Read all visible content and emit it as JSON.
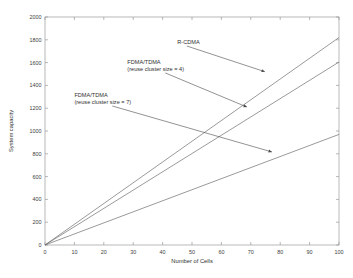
{
  "chart_data": {
    "type": "line",
    "title": "",
    "xlabel": "Number of Cells",
    "ylabel": "System capacity",
    "xlim": [
      0,
      100
    ],
    "ylim": [
      0,
      2000
    ],
    "xticks": [
      0,
      10,
      20,
      30,
      40,
      50,
      60,
      70,
      80,
      90,
      100
    ],
    "yticks": [
      0,
      200,
      400,
      600,
      800,
      1000,
      1200,
      1400,
      1600,
      1800,
      2000
    ],
    "grid": false,
    "legend_position": "none",
    "series": [
      {
        "name": "R-CDMA",
        "x": [
          0,
          100
        ],
        "values": [
          0,
          1820
        ]
      },
      {
        "name": "FDMA/TDMA (reuse cluster size = 4)",
        "x": [
          0,
          100
        ],
        "values": [
          0,
          1605
        ]
      },
      {
        "name": "FDMA/TDMA (reuse cluster size = 7)",
        "x": [
          0,
          100
        ],
        "values": [
          0,
          970
        ]
      }
    ],
    "annotations": [
      {
        "label_line1": "R-CDMA",
        "label_line2": "",
        "text_x": 45,
        "text_y": 1765,
        "arrow_x": 74.8,
        "arrow_y": 1520
      },
      {
        "label_line1": "FDMA/TDMA",
        "label_line2": "(reuse cluster size = 4)",
        "text_x": 28,
        "text_y": 1590,
        "arrow_x": 68.7,
        "arrow_y": 1210
      },
      {
        "label_line1": "FDMA/TDMA",
        "label_line2": "(reuse cluster size = 7)",
        "text_x": 10,
        "text_y": 1300,
        "arrow_x": 77.2,
        "arrow_y": 816
      }
    ]
  },
  "axes": {
    "x_tick_labels": [
      "0",
      "10",
      "20",
      "30",
      "40",
      "50",
      "60",
      "70",
      "80",
      "90",
      "100"
    ],
    "y_tick_labels": [
      "0",
      "200",
      "400",
      "600",
      "800",
      "1000",
      "1200",
      "1400",
      "1600",
      "1800",
      "2000"
    ],
    "x_axis_title": "Number of Cells",
    "y_axis_title": "System capacity"
  },
  "colors": {
    "background": "#ffffff",
    "axis": "#9a9a9a",
    "series": "#6f6f6f",
    "text": "#303030",
    "annotation_leader": "#4a4a4a"
  },
  "annotation_labels": {
    "r_cdma": "R-CDMA",
    "fdma_tdma_4_line1": "FDMA/TDMA",
    "fdma_tdma_4_line2": "(reuse cluster size = 4)",
    "fdma_tdma_7_line1": "FDMA/TDMA",
    "fdma_tdma_7_line2": "(reuse cluster size = 7)"
  }
}
